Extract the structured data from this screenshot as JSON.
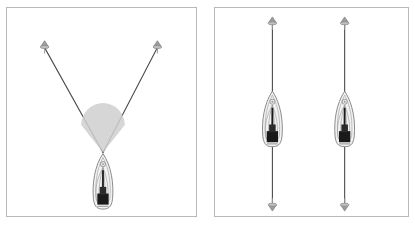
{
  "figure": {
    "type": "diagram",
    "background_color": "#ffffff",
    "panel_border_color": "#b9b9b9",
    "line_color": "#4a4a4a",
    "hull_outline_color": "#8a8a8a",
    "hull_fill_color": "#f2f2f2",
    "shadow_fill_color": "#cfcfcf",
    "crew_color": "#1a1a1a",
    "marker_color": "#9a9a9a"
  },
  "panels": [
    {
      "id": "panel-left",
      "name": "single-boat-converging-laylines",
      "label": "",
      "markers": [
        {
          "name": "marker-top-left",
          "x": 38,
          "y": 37,
          "kind": "buoy",
          "orientation": "up"
        },
        {
          "name": "marker-top-right",
          "x": 152,
          "y": 37,
          "kind": "buoy",
          "orientation": "up"
        }
      ],
      "lines": [
        {
          "name": "layline-left",
          "x1": 38,
          "y1": 40,
          "x2": 97,
          "y2": 146
        },
        {
          "name": "layline-right",
          "x1": 152,
          "y1": 40,
          "x2": 97,
          "y2": 146
        }
      ],
      "shadow": {
        "name": "wind-shadow-cone",
        "apex_x": 97,
        "apex_y": 146,
        "half_width": 22,
        "top_y": 118
      },
      "boats": [
        {
          "name": "boat-center",
          "x": 97,
          "y": 175,
          "length": 56,
          "beam": 22,
          "heading": 0
        }
      ]
    },
    {
      "id": "panel-right",
      "name": "two-boats-parallel-courses",
      "label": "",
      "markers": [
        {
          "name": "marker-left-top",
          "x": 58,
          "y": 13,
          "kind": "buoy",
          "orientation": "up"
        },
        {
          "name": "marker-left-bottom",
          "x": 58,
          "y": 201,
          "kind": "buoy",
          "orientation": "down"
        },
        {
          "name": "marker-right-top",
          "x": 131,
          "y": 13,
          "kind": "buoy",
          "orientation": "up"
        },
        {
          "name": "marker-right-bottom",
          "x": 131,
          "y": 201,
          "kind": "buoy",
          "orientation": "down"
        }
      ],
      "lines": [
        {
          "name": "course-line-left",
          "x1": 58,
          "y1": 15,
          "x2": 58,
          "y2": 199
        },
        {
          "name": "course-line-right",
          "x1": 131,
          "y1": 15,
          "x2": 131,
          "y2": 199
        }
      ],
      "boats": [
        {
          "name": "boat-left",
          "x": 58,
          "y": 112,
          "length": 56,
          "beam": 22,
          "heading": 0
        },
        {
          "name": "boat-right",
          "x": 131,
          "y": 112,
          "length": 56,
          "beam": 22,
          "heading": 0
        }
      ]
    }
  ]
}
